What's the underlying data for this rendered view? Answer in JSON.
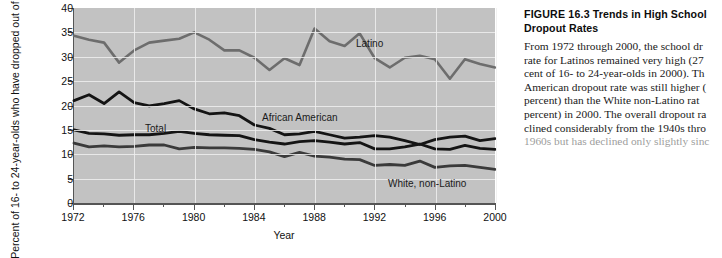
{
  "figure": {
    "number": "FIGURE 16.3",
    "title": "Trends in High School",
    "title_line2": "Dropout Rates",
    "caption_lines": [
      "From 1972 through 2000, the school dr",
      "rate for Latinos remained very high (27",
      "cent of 16- to 24-year-olds in 2000). Th",
      "American dropout rate was still higher (",
      "percent) than the White non-Latino rat",
      "percent) in 2000. The overall dropout ra",
      "clined considerably from the 1940s thro",
      "1960s but has declined only slightly sinc"
    ]
  },
  "chart_data": {
    "type": "line",
    "title": "Trends in High School Dropout Rates",
    "xlabel": "Year",
    "ylabel": "Percent of 16- to 24-year-olds who have dropped out of school",
    "xlim": [
      1972,
      2000
    ],
    "ylim": [
      0,
      40
    ],
    "yticks": [
      0,
      5,
      10,
      15,
      20,
      25,
      30,
      35,
      40
    ],
    "xticks_major": [
      1972,
      1976,
      1980,
      1984,
      1988,
      1992,
      1996,
      2000
    ],
    "xticks_minor": [
      1974,
      1978,
      1982,
      1986,
      1990,
      1994,
      1998
    ],
    "grid": true,
    "legend_position": "inline-labels",
    "x": [
      1972,
      1973,
      1974,
      1975,
      1976,
      1977,
      1978,
      1979,
      1980,
      1981,
      1982,
      1983,
      1984,
      1985,
      1986,
      1987,
      1988,
      1989,
      1990,
      1991,
      1992,
      1993,
      1994,
      1995,
      1996,
      1997,
      1998,
      1999,
      2000
    ],
    "series": [
      {
        "name": "Latino",
        "color": "#6d6d6d",
        "values": [
          34.3,
          33.5,
          32.9,
          28.8,
          31.3,
          32.9,
          33.3,
          33.7,
          35.0,
          33.5,
          31.3,
          31.3,
          29.8,
          27.3,
          29.7,
          28.3,
          35.8,
          33.2,
          32.2,
          34.8,
          29.7,
          27.8,
          29.8,
          30.2,
          29.5,
          25.5,
          29.5,
          28.5,
          27.8
        ]
      },
      {
        "name": "African American",
        "color": "#141414",
        "values": [
          21.0,
          22.2,
          20.4,
          22.8,
          20.6,
          19.9,
          20.4,
          21.0,
          19.3,
          18.3,
          18.5,
          17.9,
          16.0,
          15.3,
          14.0,
          14.2,
          14.7,
          14.0,
          13.3,
          13.5,
          13.8,
          13.5,
          12.8,
          12.0,
          13.0,
          13.5,
          13.7,
          12.8,
          13.2
        ]
      },
      {
        "name": "Total",
        "color": "#141414",
        "values": [
          15.0,
          14.3,
          14.2,
          13.9,
          14.0,
          14.0,
          14.3,
          14.7,
          14.3,
          14.0,
          13.9,
          13.8,
          13.0,
          12.5,
          12.1,
          12.6,
          12.8,
          12.5,
          12.1,
          12.4,
          11.1,
          11.1,
          11.5,
          12.1,
          11.1,
          11.0,
          11.8,
          11.2,
          11.0
        ]
      },
      {
        "name": "White, non-Latino",
        "color": "#3a3a3a",
        "values": [
          12.3,
          11.5,
          11.7,
          11.5,
          11.6,
          11.9,
          11.9,
          11.1,
          11.4,
          11.3,
          11.3,
          11.2,
          11.0,
          10.5,
          9.5,
          10.4,
          9.6,
          9.4,
          9.0,
          8.9,
          7.7,
          7.9,
          7.7,
          8.6,
          7.3,
          7.6,
          7.7,
          7.3,
          6.9
        ]
      }
    ],
    "annotations": [
      {
        "text": "Latino",
        "x_px": 356,
        "y_px": 38
      },
      {
        "text": "African American",
        "x_px": 262,
        "y_px": 112
      },
      {
        "text": "Total",
        "x_px": 145,
        "y_px": 123
      },
      {
        "text": "White, non-Latino",
        "x_px": 388,
        "y_px": 178
      }
    ]
  }
}
